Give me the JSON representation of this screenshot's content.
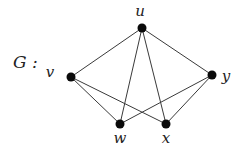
{
  "graph": {
    "name": "G :",
    "nodes": [
      {
        "id": "u",
        "label": "u",
        "x": 142,
        "y": 28,
        "lx": 140,
        "ly": 16
      },
      {
        "id": "v",
        "label": "v",
        "x": 71,
        "y": 77,
        "lx": 50,
        "ly": 77
      },
      {
        "id": "y",
        "label": "y",
        "x": 212,
        "y": 75,
        "lx": 226,
        "ly": 81
      },
      {
        "id": "w",
        "label": "w",
        "x": 120,
        "y": 124,
        "lx": 120,
        "ly": 143
      },
      {
        "id": "x",
        "label": "x",
        "x": 166,
        "y": 124,
        "lx": 166,
        "ly": 143
      }
    ],
    "edges": [
      [
        "u",
        "v"
      ],
      [
        "u",
        "w"
      ],
      [
        "u",
        "x"
      ],
      [
        "u",
        "y"
      ],
      [
        "v",
        "w"
      ],
      [
        "v",
        "x"
      ],
      [
        "y",
        "w"
      ],
      [
        "y",
        "x"
      ]
    ]
  }
}
